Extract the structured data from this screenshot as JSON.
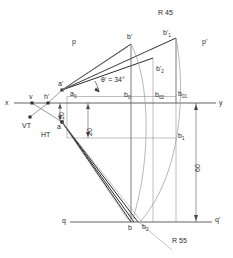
{
  "drawing": {
    "title": "Descriptive geometry construction: line inclined to plane",
    "axes": {
      "x_label": "x",
      "y_label": "y",
      "q_label": "q",
      "q_prime_label": "q'",
      "p_label": "p",
      "p_prime_label": "p'"
    },
    "points": {
      "v": "v",
      "h_prime": "h'",
      "a_prime": "a'",
      "a": "a",
      "a_0": "a",
      "a_0_sub": "0",
      "b_prime": "b'",
      "b_prime_1": "b'",
      "b_prime_1_sub": "1",
      "b_prime_2": "b'",
      "b_prime_2_sub": "2",
      "b_0": "b",
      "b_0_sub": "0",
      "b_02": "b",
      "b_02_sub": "02",
      "b_01": "b",
      "b_01_sub": "01",
      "b_1": "b",
      "b_1_sub": "1",
      "b": "b",
      "b_2": "b",
      "b_2_sub": "2"
    },
    "traces": {
      "vertical_trace": "VT",
      "horizontal_trace": "HT"
    },
    "dimensions": {
      "angle": "θ' = 34°",
      "height_10": "10",
      "height_20": "20",
      "length_60": "60",
      "radius_45": "R 45",
      "radius_55": "R 55"
    },
    "colors": {
      "line": "#3a3a3a",
      "thin_line": "#707070",
      "arc": "#8a8a8a",
      "text": "#2b2b2b"
    }
  }
}
